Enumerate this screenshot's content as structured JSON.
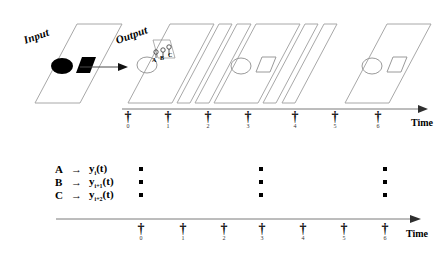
{
  "figure": {
    "title_labels": {
      "input_plane": "Input",
      "output_plane": "Output"
    },
    "axes": {
      "top_time_label": "Time",
      "bottom_time_label": "Time"
    },
    "ticks": {
      "glyph": "†",
      "subscripts": [
        "0",
        "1",
        "2",
        "3",
        "4",
        "5",
        "6"
      ]
    },
    "legend": {
      "arrow": "→",
      "rows": [
        {
          "key": "A",
          "fn_base": "y",
          "fn_sub": "i",
          "fn_arg": "(t)"
        },
        {
          "key": "B",
          "fn_base": "y",
          "fn_sub": "i+1",
          "fn_arg": "(t)"
        },
        {
          "key": "C",
          "fn_base": "y",
          "fn_sub": "i+2",
          "fn_arg": "(t)"
        }
      ]
    },
    "output_markers": [
      "A",
      "B",
      "C"
    ],
    "colors": {
      "plane_stroke": "#a8a8a8",
      "axis": "#7a7a7a",
      "shape_fill": "#000000",
      "shape_stroke": "#9a9a9a",
      "ink": "#000000"
    },
    "planes": [
      {
        "index": 0,
        "name": "input-plane",
        "shapes": [
          "filled-ellipse",
          "filled-square"
        ]
      },
      {
        "index": 1,
        "name": "output-plane",
        "shapes": [
          "outline-ellipse"
        ]
      },
      {
        "index": 2,
        "name": "plane-t1",
        "shapes": []
      },
      {
        "index": 3,
        "name": "plane-t2",
        "shapes": []
      },
      {
        "index": 4,
        "name": "plane-t3",
        "shapes": [
          "outline-ellipse",
          "outline-square"
        ]
      },
      {
        "index": 5,
        "name": "plane-t4",
        "shapes": []
      },
      {
        "index": 6,
        "name": "plane-t5",
        "shapes": []
      },
      {
        "index": 7,
        "name": "plane-t6",
        "shapes": [
          "outline-ellipse",
          "outline-square"
        ]
      }
    ],
    "spike_raster": {
      "rows": [
        "A",
        "B",
        "C"
      ],
      "columns": [
        "0",
        "3",
        "6"
      ]
    }
  }
}
